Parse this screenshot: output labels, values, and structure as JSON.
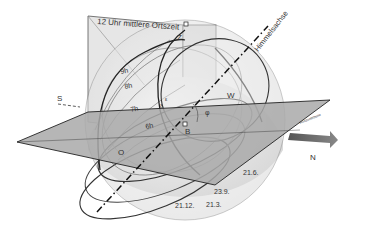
{
  "diagram": {
    "title_banner": "12 Uhr mittlere Ortszeit",
    "axis_label": "Himmelsachse",
    "horizon_label": "Horizontebene",
    "points": {
      "zenith": "Z",
      "south": "S",
      "north": "N",
      "west": "W",
      "east": "O",
      "observer": "B",
      "latitude_angle": "φ",
      "small_angle_1": "ε",
      "small_angle_2": "δ"
    },
    "hour_labels": [
      "9h",
      "8h",
      "7h",
      "6h"
    ],
    "date_labels": [
      "21.6.",
      "23.9.",
      "21.3.",
      "21.12."
    ],
    "colors": {
      "plane_fill": "#a9a9a9",
      "sphere_fill": "#ececec",
      "meridian_fill": "#e2e2e2",
      "line_dark": "#222222",
      "line_mid": "#777777",
      "arrow": "#6e6e6e"
    }
  }
}
